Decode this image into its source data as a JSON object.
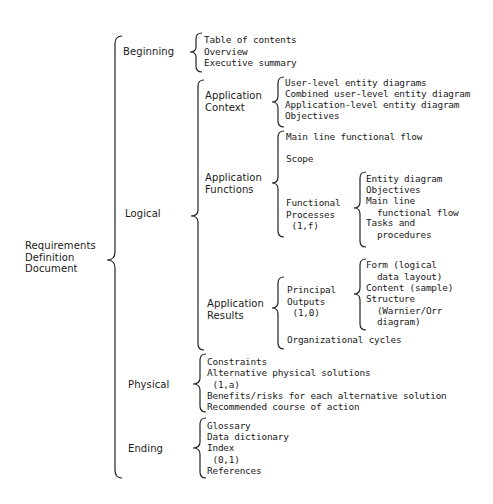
{
  "diagram": {
    "type": "warnier-orr-bracket-diagram",
    "root": {
      "label": "Requirements\nDefinition\nDocument"
    },
    "sections": [
      {
        "label": "Beginning",
        "items": [
          "Table of contents",
          "Overview",
          "Executive summary"
        ]
      },
      {
        "label": "Logical",
        "groups": [
          {
            "label": "Application\nContext",
            "items": [
              "User-level entity diagrams",
              "Combined user-level entity diagram",
              "Application-level entity diagram",
              "Objectives"
            ]
          },
          {
            "label": "Application\nFunctions",
            "items": [
              {
                "label": "Main line functional flow"
              },
              {
                "label": "Scope"
              },
              {
                "label": "Functional\nProcesses\n (1,f)",
                "items": [
                  "Entity diagram",
                  "Objectives",
                  "Main line\n  functional flow",
                  "Tasks and\n  procedures"
                ]
              }
            ]
          },
          {
            "label": "Application\nResults",
            "items": [
              {
                "label": "Principal\nOutputs\n (1,0)",
                "items": [
                  "Form (logical\n  data layout)",
                  "Content (sample)",
                  "Structure\n  (Warnier/Orr\n  diagram)"
                ]
              },
              {
                "label": "Organizational cycles"
              }
            ]
          }
        ]
      },
      {
        "label": "Physical",
        "items": [
          "Constraints",
          "Alternative physical solutions\n (1,a)",
          "Benefits/risks for each alternative solution",
          "Recommended course of action"
        ]
      },
      {
        "label": "Ending",
        "items": [
          "Glossary",
          "Data dictionary",
          "Index\n (0,1)",
          "References"
        ]
      }
    ]
  }
}
